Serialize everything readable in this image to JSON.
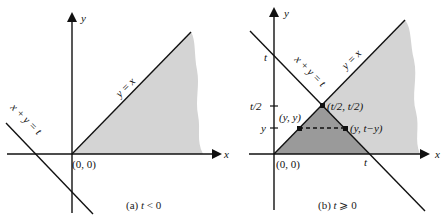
{
  "panels": [
    {
      "id": "a",
      "caption": "(a) t < 0",
      "axis_x_label": "x",
      "axis_y_label": "y",
      "origin_label": "(0, 0)",
      "line_diagonal_label": "y = x",
      "line_anti_label": "x + y = t",
      "colors": {
        "region": "#d4d4d4",
        "line": "#111111"
      }
    },
    {
      "id": "b",
      "caption": "(b) t ⩾ 0",
      "axis_x_label": "x",
      "axis_y_label": "y",
      "origin_label": "(0, 0)",
      "line_diagonal_label": "y = x",
      "line_anti_label": "x + y = t",
      "y_ticks": [
        "t",
        "t/2",
        "y"
      ],
      "x_tick": "t",
      "points": {
        "intersection": "(t/2, t/2)",
        "left": "(y, y)",
        "right": "(y, t−y)"
      },
      "colors": {
        "region": "#d4d4d4",
        "triangle": "#9a9a9a",
        "line": "#111111"
      }
    }
  ]
}
